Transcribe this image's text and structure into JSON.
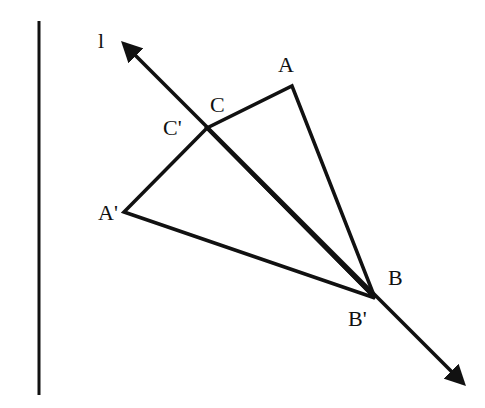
{
  "diagram": {
    "type": "geometric-reflection",
    "line_label": "l",
    "vertex_labels": {
      "A": "A",
      "B": "B",
      "C": "C",
      "A_prime": "A'",
      "B_prime": "B'",
      "C_prime": "C'"
    },
    "colors": {
      "stroke": "#111111",
      "background": "#ffffff"
    }
  }
}
